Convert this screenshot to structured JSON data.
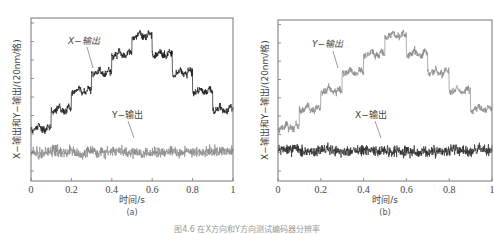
{
  "caption": "图4.6  在X方向和Y方向测试编码器分辨率",
  "chart_data": [
    {
      "type": "line",
      "panel_label": "(a)",
      "xlabel": "时间/s",
      "ylabel": "X−输出和Y−输出/(20nm/格)",
      "xlim": [
        0,
        1
      ],
      "xticks": [
        "0",
        "0.2",
        "0.4",
        "0.6",
        "0.8",
        "1"
      ],
      "grid": false,
      "series": [
        {
          "name": "X−输出",
          "color": "#1a1a1a",
          "kind": "staircase",
          "x_steps": [
            0,
            0.1,
            0.2,
            0.3,
            0.4,
            0.5,
            0.6,
            0.7,
            0.8,
            0.9,
            1.0
          ],
          "levels": [
            0,
            1,
            2,
            3,
            4,
            5,
            4,
            3,
            2,
            1
          ]
        },
        {
          "name": "Y−输出",
          "color": "#8a8a8a",
          "kind": "noise",
          "level": -1.3
        }
      ],
      "annotations": [
        {
          "text": "X−输出",
          "series": "X−输出"
        },
        {
          "text": "Y−输出",
          "series": "Y−输出"
        }
      ]
    },
    {
      "type": "line",
      "panel_label": "(b)",
      "xlabel": "时间/s",
      "ylabel": "X−输出和Y−输出/(20nm/格)",
      "xlim": [
        0,
        1
      ],
      "xticks": [
        "0",
        "0.2",
        "0.4",
        "0.6",
        "0.8",
        "1"
      ],
      "grid": false,
      "series": [
        {
          "name": "Y−输出",
          "color": "#8a8a8a",
          "kind": "staircase",
          "x_steps": [
            0,
            0.1,
            0.2,
            0.3,
            0.4,
            0.5,
            0.6,
            0.7,
            0.8,
            0.9,
            1.0
          ],
          "levels": [
            0,
            1,
            2,
            3,
            4,
            5,
            4,
            3,
            2,
            1
          ]
        },
        {
          "name": "X−输出",
          "color": "#2a2a2a",
          "kind": "noise",
          "level": -1.3
        }
      ],
      "annotations": [
        {
          "text": "Y−输出",
          "series": "Y−输出"
        },
        {
          "text": "X−输出",
          "series": "X−输出"
        }
      ]
    }
  ],
  "panels": {
    "a": {
      "label": "(a)",
      "xlabel": "时间/s",
      "ylabel": "X−输出和Y−输出/(20nm/格)",
      "ann_top": "X−输出",
      "ann_bottom": "Y−输出",
      "xticks": [
        "0",
        "0.2",
        "0.4",
        "0.6",
        "0.8",
        "1"
      ]
    },
    "b": {
      "label": "(b)",
      "xlabel": "时间/s",
      "ylabel": "X−输出和Y−输出/(20nm/格)",
      "ann_top": "Y−输出",
      "ann_bottom": "X−输出",
      "xticks": [
        "0",
        "0.2",
        "0.4",
        "0.6",
        "0.8",
        "1"
      ]
    }
  }
}
